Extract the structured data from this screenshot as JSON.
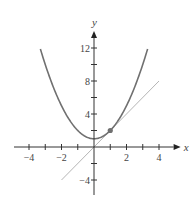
{
  "chart_data": {
    "type": "line",
    "title": "",
    "xlabel": "x",
    "ylabel": "y",
    "xlim": [
      -5,
      5
    ],
    "ylim": [
      -5,
      14
    ],
    "x_ticks": [
      -4,
      -3,
      -2,
      -1,
      0,
      1,
      2,
      3,
      4
    ],
    "x_tick_labels": [
      "−4",
      "−2",
      "2",
      "4"
    ],
    "x_tick_label_values": [
      -4,
      -2,
      2,
      4
    ],
    "y_ticks": [
      -4,
      -2,
      2,
      4,
      6,
      8,
      10,
      12
    ],
    "y_tick_labels": [
      "−4",
      "4",
      "8",
      "12"
    ],
    "y_tick_label_values": [
      -4,
      4,
      8,
      12
    ],
    "grid": false,
    "series": [
      {
        "name": "parabola",
        "equation": "y = x^2 + 1",
        "x_range": [
          -3.3,
          3.3
        ],
        "color": "#707070"
      },
      {
        "name": "tangent line",
        "equation": "y = 2x",
        "x_range": [
          -2,
          4
        ],
        "color": "#b5b5b5"
      }
    ],
    "points": [
      {
        "name": "point of tangency",
        "x": 1,
        "y": 2,
        "color": "#707070"
      }
    ]
  }
}
